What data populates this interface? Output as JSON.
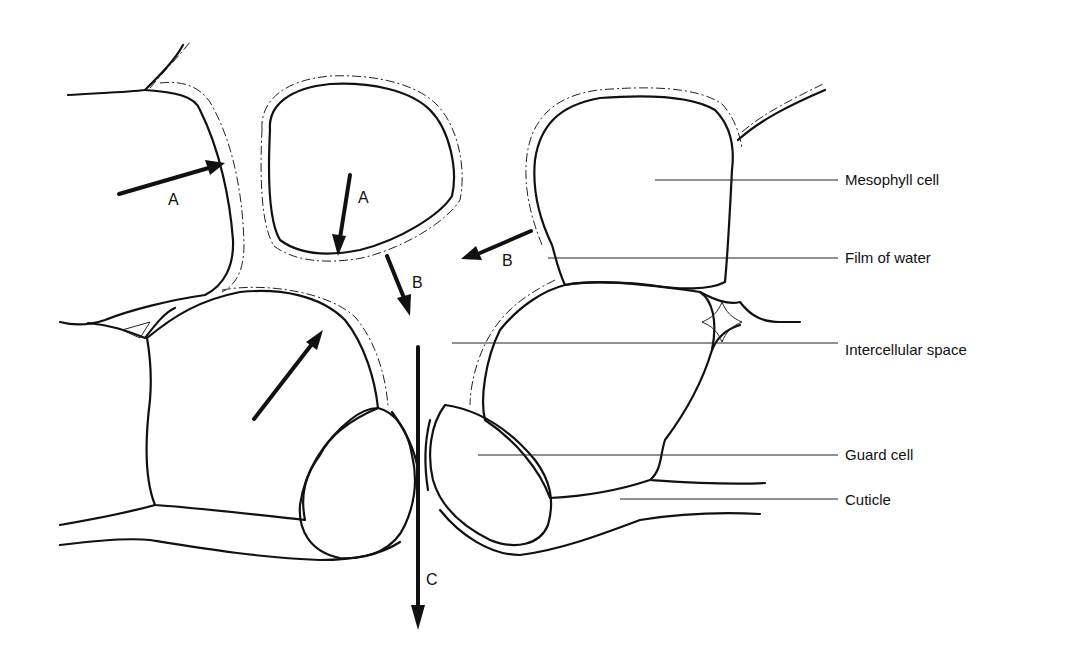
{
  "diagram": {
    "labels": {
      "mesophyll_cell": "Mesophyll cell",
      "film_of_water": "Film of water",
      "intercellular_space": "Intercellular space",
      "guard_cell": "Guard cell",
      "cuticle": "Cuticle"
    },
    "arrows": {
      "a_left": "A",
      "a_center": "A",
      "b_center": "B",
      "b_right": "B",
      "c_stoma": "C"
    },
    "colors": {
      "line": "#111111",
      "background": "#ffffff"
    }
  }
}
